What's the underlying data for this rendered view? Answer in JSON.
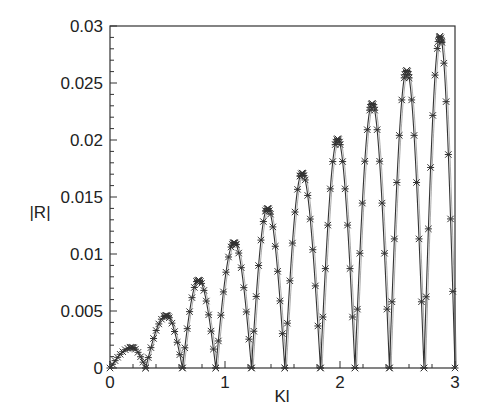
{
  "chart_data": {
    "type": "line",
    "title": "",
    "xlabel": "Kl",
    "ylabel": "|R|",
    "xlim": [
      0,
      3
    ],
    "ylim": [
      0,
      0.03
    ],
    "x_ticks": [
      "0",
      "1",
      "2",
      "3"
    ],
    "y_ticks": [
      "0",
      "0.005",
      "0.01",
      "0.015",
      "0.02",
      "0.025",
      "0.03"
    ],
    "grid": false,
    "legend": null,
    "series": [
      {
        "name": "analytical (line)",
        "style": "solid line",
        "description": "Rectified oscillation |R|(Kl) with lobes of linearly increasing amplitude"
      },
      {
        "name": "numerical (markers)",
        "style": "asterisk markers",
        "description": "Markers overlaid on the line"
      }
    ],
    "lobes": {
      "zeros_x": [
        0,
        0.31,
        0.63,
        0.92,
        1.23,
        1.52,
        1.83,
        2.13,
        2.43,
        2.73,
        3.0
      ],
      "peaks_x": [
        0.19,
        0.49,
        0.77,
        1.08,
        1.37,
        1.67,
        1.98,
        2.28,
        2.58,
        2.87
      ],
      "peaks_y": [
        0.0018,
        0.0046,
        0.0077,
        0.011,
        0.014,
        0.0171,
        0.0201,
        0.0232,
        0.0261,
        0.0291
      ]
    },
    "colors": {
      "line": "#333333",
      "marker": "#333333",
      "axes": "#333333"
    }
  }
}
